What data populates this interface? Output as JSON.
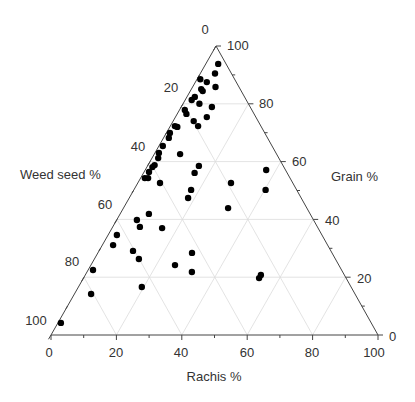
{
  "chart_data": {
    "type": "scatter",
    "subtype": "ternary",
    "title": "",
    "axes": {
      "bottom": {
        "label": "Rachis %",
        "ticks": [
          "0",
          "20",
          "40",
          "60",
          "80",
          "100"
        ]
      },
      "left": {
        "label": "Weed seed %",
        "ticks": [
          "0",
          "20",
          "40",
          "60",
          "80",
          "100"
        ]
      },
      "right": {
        "label": "Grain %",
        "ticks": [
          "0",
          "20",
          "40",
          "60",
          "80",
          "100"
        ]
      }
    },
    "grid": true,
    "legend": null,
    "marker_color": "#000000",
    "point_fields": [
      "rachis",
      "grain",
      "weed_seed"
    ],
    "points": [
      [
        3.8,
        93.8,
        2.4
      ],
      [
        3.5,
        87.5,
        9.0
      ],
      [
        7.0,
        85.8,
        7.2
      ],
      [
        3.0,
        85.1,
        11.9
      ],
      [
        3.8,
        84.4,
        11.8
      ],
      [
        2.4,
        82.4,
        15.2
      ],
      [
        2.0,
        81.3,
        16.7
      ],
      [
        9.4,
        78.9,
        11.7
      ],
      [
        9.6,
        75.4,
        15.0
      ],
      [
        6.3,
        74.0,
        19.7
      ],
      [
        1.6,
        77.9,
        20.5
      ],
      [
        2.3,
        72.0,
        25.7
      ],
      [
        8.5,
        72.3,
        19.2
      ],
      [
        1.4,
        72.3,
        26.3
      ],
      [
        1.1,
        69.9,
        29.0
      ],
      [
        1.6,
        68.2,
        30.2
      ],
      [
        1.2,
        65.4,
        33.4
      ],
      [
        1.9,
        61.2,
        36.9
      ],
      [
        2.0,
        58.8,
        39.2
      ],
      [
        1.7,
        58.1,
        40.2
      ],
      [
        1.5,
        56.4,
        42.1
      ],
      [
        2.3,
        54.3,
        43.4
      ],
      [
        1.3,
        54.3,
        44.4
      ],
      [
        6.8,
        52.6,
        40.6
      ],
      [
        7.9,
        62.6,
        29.5
      ],
      [
        15.7,
        58.5,
        25.8
      ],
      [
        15.6,
        56.1,
        28.3
      ],
      [
        17.5,
        50.2,
        32.3
      ],
      [
        18.0,
        47.4,
        34.6
      ],
      [
        28.5,
        52.6,
        18.9
      ],
      [
        37.0,
        57.1,
        5.9
      ],
      [
        40.3,
        50.2,
        9.5
      ],
      [
        32.0,
        43.9,
        24.1
      ],
      [
        8.8,
        41.9,
        49.3
      ],
      [
        6.2,
        39.8,
        54.0
      ],
      [
        8.3,
        37.4,
        54.3
      ],
      [
        15.3,
        37.0,
        47.7
      ],
      [
        2.7,
        34.6,
        62.7
      ],
      [
        3.3,
        31.1,
        65.6
      ],
      [
        10.4,
        29.1,
        60.5
      ],
      [
        13.6,
        26.3,
        60.1
      ],
      [
        28.8,
        28.4,
        42.8
      ],
      [
        25.7,
        24.2,
        50.1
      ],
      [
        32.1,
        21.8,
        46.1
      ],
      [
        1.5,
        22.5,
        76.0
      ],
      [
        19.4,
        16.6,
        64.0
      ],
      [
        5.1,
        14.2,
        80.7
      ],
      [
        53.7,
        20.8,
        25.5
      ],
      [
        53.7,
        19.7,
        26.6
      ],
      [
        0.9,
        4.2,
        94.9
      ],
      [
        4.5,
        90.5,
        5.0
      ],
      [
        5.0,
        80.0,
        15.0
      ],
      [
        2.8,
        76.5,
        20.7
      ],
      [
        1.0,
        88.5,
        10.5
      ],
      [
        1.2,
        63.0,
        35.8
      ]
    ]
  }
}
